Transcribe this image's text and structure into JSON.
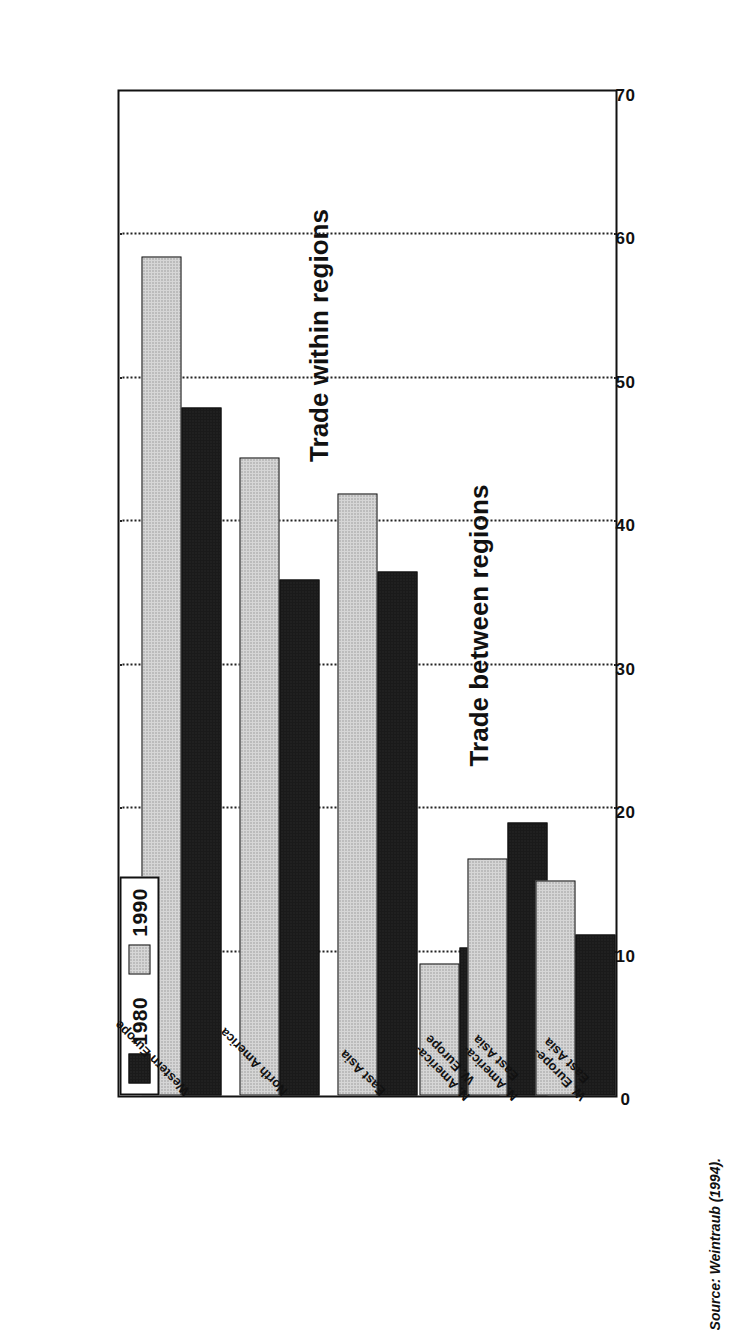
{
  "figure": {
    "source_note": "Source: Weintraub (1994).",
    "legend": {
      "items": [
        {
          "label": "1980",
          "swatch": "solid-black-swatch",
          "color": "#1a1a1a"
        },
        {
          "label": "1990",
          "swatch": "dotted-gray-swatch",
          "color": "#d6d6d6"
        }
      ]
    },
    "panel_titles": {
      "within": "Trade within regions",
      "between": "Trade between regions"
    }
  },
  "chart_data": {
    "type": "bar",
    "orientation": "horizontal",
    "title": "",
    "xlabel": "",
    "ylabel": "",
    "xlim": [
      0,
      70
    ],
    "ticks": [
      0,
      10,
      20,
      30,
      40,
      50,
      60,
      70
    ],
    "grid": true,
    "legend_position": "top-left",
    "categories": [
      "Western Europe",
      "North America",
      "East Asia",
      "N. America-\nW. Europe",
      "N. America-\nEast Asia",
      "W. Europe-\nEast Asia"
    ],
    "category_labels": [
      {
        "line1": "Western Europe",
        "line2": "",
        "group": "within"
      },
      {
        "line1": "North America",
        "line2": "",
        "group": "within"
      },
      {
        "line1": "East Asia",
        "line2": "",
        "group": "within"
      },
      {
        "line1": "N. America-",
        "line2": "W. Europe",
        "group": "between"
      },
      {
        "line1": "N. America-",
        "line2": "East Asia",
        "group": "between"
      },
      {
        "line1": "W. Europe-",
        "line2": "East Asia",
        "group": "between"
      }
    ],
    "series": [
      {
        "name": "1980",
        "color": "#1a1a1a",
        "values": [
          48,
          36,
          36.5,
          10.3,
          19,
          11.2
        ]
      },
      {
        "name": "1990",
        "color": "#d6d6d6",
        "values": [
          58.5,
          44.5,
          42,
          9.2,
          16.5,
          15
        ]
      }
    ],
    "groups": [
      {
        "label": "Trade within regions",
        "categories": [
          "Western Europe",
          "North America",
          "East Asia"
        ]
      },
      {
        "label": "Trade between regions",
        "categories": [
          "N. America-\nW. Europe",
          "N. America-\nEast Asia",
          "W. Europe-\nEast Asia"
        ]
      }
    ]
  }
}
